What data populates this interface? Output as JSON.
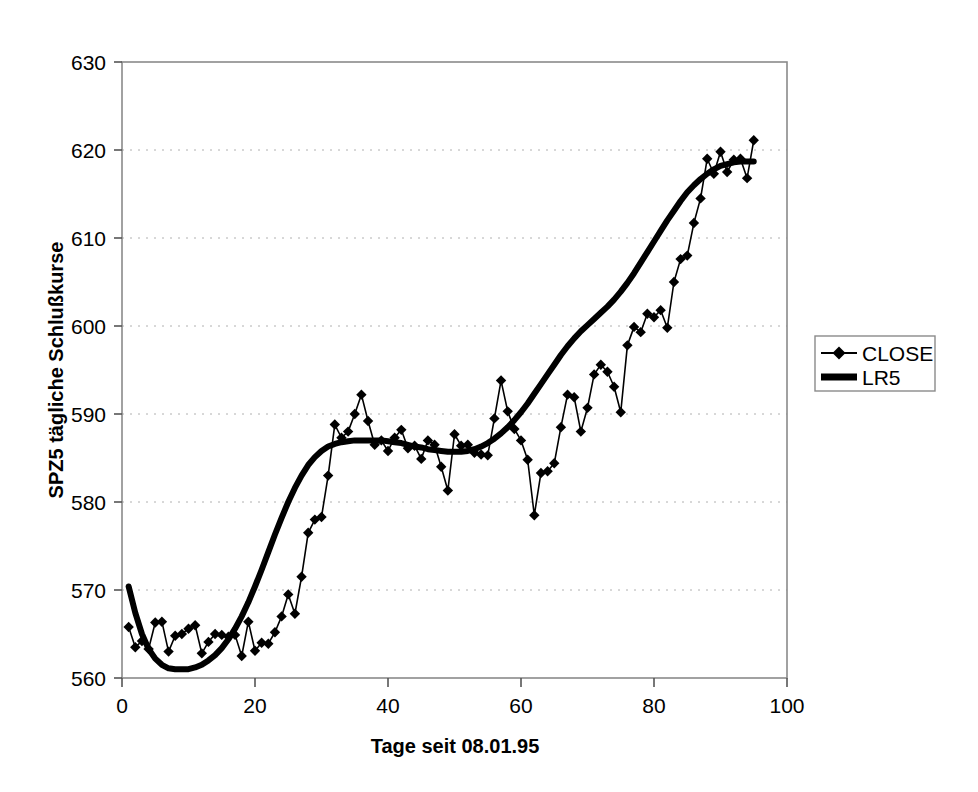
{
  "chart_data": {
    "type": "line",
    "title": "",
    "xlabel": "Tage seit 08.01.95",
    "ylabel": "SPZ5 tägliche Schlußkurse",
    "xlim": [
      0,
      100
    ],
    "ylim": [
      560,
      630
    ],
    "xticks": [
      0,
      20,
      40,
      60,
      80,
      100
    ],
    "yticks": [
      560,
      570,
      580,
      590,
      600,
      610,
      620,
      630
    ],
    "grid": "horizontal-dotted",
    "legend_position": "right",
    "x": [
      1,
      2,
      3,
      4,
      5,
      6,
      7,
      8,
      9,
      10,
      11,
      12,
      13,
      14,
      15,
      16,
      17,
      18,
      19,
      20,
      21,
      22,
      23,
      24,
      25,
      26,
      27,
      28,
      29,
      30,
      31,
      32,
      33,
      34,
      35,
      36,
      37,
      38,
      39,
      40,
      41,
      42,
      43,
      44,
      45,
      46,
      47,
      48,
      49,
      50,
      51,
      52,
      53,
      54,
      55,
      56,
      57,
      58,
      59,
      60,
      61,
      62,
      63,
      64,
      65,
      66,
      67,
      68,
      69,
      70,
      71,
      72,
      73,
      74,
      75,
      76,
      77,
      78,
      79,
      80,
      81,
      82,
      83,
      84,
      85,
      86,
      87,
      88,
      89,
      90,
      91,
      92,
      93,
      94,
      95
    ],
    "series": [
      {
        "name": "CLOSE",
        "marker": "diamond",
        "line_width": 1.6,
        "color": "#000000",
        "values": [
          565.8,
          563.5,
          564.2,
          563.3,
          566.3,
          566.4,
          563.0,
          564.8,
          565.0,
          565.6,
          566.0,
          562.8,
          564.1,
          565.0,
          564.9,
          564.7,
          564.9,
          562.5,
          566.4,
          563.1,
          564.0,
          563.9,
          565.2,
          567.0,
          569.5,
          567.3,
          571.5,
          576.5,
          578.0,
          578.3,
          583.0,
          588.8,
          587.3,
          588.0,
          590.0,
          592.2,
          589.2,
          586.5,
          587.0,
          585.8,
          587.3,
          588.2,
          586.1,
          586.4,
          584.9,
          587.0,
          586.5,
          584.0,
          581.3,
          587.7,
          586.4,
          586.5,
          585.6,
          585.4,
          585.3,
          589.5,
          593.8,
          590.3,
          588.3,
          587.0,
          584.8,
          578.5,
          583.3,
          583.5,
          584.4,
          588.5,
          592.2,
          591.9,
          588.0,
          590.7,
          594.5,
          595.6,
          594.8,
          593.1,
          590.2,
          597.8,
          599.9,
          599.3,
          601.4,
          601.0,
          601.8,
          599.8,
          605.0,
          607.6,
          608.0,
          611.7,
          614.5,
          619.0,
          617.3,
          619.8,
          617.5,
          618.9,
          619.0,
          616.8,
          621.1
        ]
      },
      {
        "name": "LR5",
        "marker": "none",
        "line_width": 6,
        "color": "#000000",
        "values": [
          570.4,
          567.4,
          565.0,
          563.3,
          562.2,
          561.5,
          561.1,
          561.0,
          561.0,
          561.0,
          561.2,
          561.5,
          562.0,
          562.6,
          563.4,
          564.4,
          565.6,
          567.0,
          568.6,
          570.4,
          572.3,
          574.3,
          576.3,
          578.2,
          580.0,
          581.6,
          583.0,
          584.2,
          585.1,
          585.8,
          586.3,
          586.6,
          586.8,
          586.9,
          587.0,
          587.0,
          587.0,
          587.0,
          587.0,
          586.9,
          586.8,
          586.7,
          586.5,
          586.3,
          586.2,
          586.0,
          585.9,
          585.8,
          585.7,
          585.7,
          585.7,
          585.8,
          586.0,
          586.3,
          586.7,
          587.2,
          587.8,
          588.5,
          589.3,
          590.2,
          591.2,
          592.3,
          593.4,
          594.5,
          595.6,
          596.7,
          597.7,
          598.6,
          599.4,
          600.1,
          600.8,
          601.5,
          602.2,
          603.0,
          603.9,
          604.9,
          606.0,
          607.2,
          608.4,
          609.6,
          610.8,
          612.0,
          613.1,
          614.2,
          615.2,
          616.0,
          616.7,
          617.3,
          617.8,
          618.2,
          618.4,
          618.6,
          618.7,
          618.7,
          618.7
        ]
      }
    ]
  },
  "axes": {
    "x_title": "Tage seit 08.01.95",
    "y_title": "SPZ5 tägliche Schlußkurse",
    "x_tick_labels": [
      "0",
      "20",
      "40",
      "60",
      "80",
      "100"
    ],
    "y_tick_labels": [
      "560",
      "570",
      "580",
      "590",
      "600",
      "610",
      "620",
      "630"
    ]
  },
  "legend": {
    "entries": [
      {
        "label": "CLOSE",
        "style": "thin-line-with-diamond"
      },
      {
        "label": "LR5",
        "style": "thick-line"
      }
    ]
  },
  "colors": {
    "plot_background": "#ffffff",
    "axis": "#808080",
    "gridline": "#b0b0b0",
    "data": "#000000",
    "legend_border": "#808080"
  }
}
